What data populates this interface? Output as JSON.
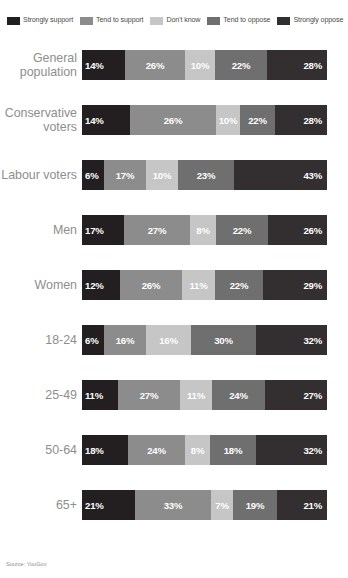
{
  "legend": {
    "items": [
      {
        "label": "Strongly support",
        "color": "#231f20"
      },
      {
        "label": "Tend to support",
        "color": "#8c8c8c"
      },
      {
        "label": "Don't know",
        "color": "#c6c6c6"
      },
      {
        "label": "Tend to oppose",
        "color": "#6f6f6f"
      },
      {
        "label": "Strongly oppose",
        "color": "#332f30"
      }
    ]
  },
  "source": {
    "text": "Source: YouGov"
  },
  "chart_data": {
    "type": "bar",
    "orientation": "horizontal",
    "stacked": true,
    "normalized": true,
    "title": "",
    "xlabel": "",
    "ylabel": "",
    "xlim": [
      0,
      100
    ],
    "grid": false,
    "legend_position": "top-left",
    "categories": [
      "General population",
      "Conservative voters",
      "Labour voters",
      "Men",
      "Women",
      "18-24",
      "25-49",
      "50-64",
      "65+"
    ],
    "series": [
      {
        "name": "Strongly support",
        "color": "#231f20",
        "values": [
          14,
          14,
          6,
          17,
          12,
          6,
          11,
          18,
          21
        ]
      },
      {
        "name": "Tend to support",
        "color": "#8c8c8c",
        "values": [
          26,
          26,
          17,
          27,
          26,
          16,
          27,
          24,
          33
        ]
      },
      {
        "name": "Don't know",
        "color": "#c6c6c6",
        "values": [
          10,
          10,
          10,
          8,
          11,
          16,
          11,
          8,
          7
        ]
      },
      {
        "name": "Tend to oppose",
        "color": "#6f6f6f",
        "values": [
          22,
          22,
          23,
          22,
          22,
          30,
          24,
          18,
          19
        ]
      },
      {
        "name": "Strongly oppose",
        "color": "#332f30",
        "values": [
          28,
          28,
          43,
          26,
          29,
          32,
          27,
          32,
          21
        ]
      }
    ]
  },
  "rows": [
    {
      "label": "General\npopulation",
      "label_lines": [
        "General",
        "population"
      ],
      "bar_top": 14,
      "bar_height": 30,
      "segments": [
        {
          "name": "Strongly support",
          "value": "14%",
          "color": "#231f20",
          "width": 43,
          "align": "left"
        },
        {
          "name": "Tend to support",
          "value": "26%",
          "color": "#8c8c8c",
          "width": 60,
          "align": "center"
        },
        {
          "name": "Don't know",
          "value": "10%",
          "color": "#c6c6c6",
          "width": 30,
          "align": "center"
        },
        {
          "name": "Tend to oppose",
          "value": "22%",
          "color": "#6f6f6f",
          "width": 52,
          "align": "center"
        },
        {
          "name": "Strongly oppose",
          "value": "28%",
          "color": "#332f30",
          "width": 60,
          "align": "right"
        }
      ]
    },
    {
      "label": "Conservative\nvoters",
      "label_lines": [
        "Conservative",
        "voters"
      ],
      "bar_top": 14,
      "bar_height": 30,
      "segments": [
        {
          "name": "Strongly support",
          "value": "14%",
          "color": "#231f20",
          "width": 48,
          "align": "left"
        },
        {
          "name": "Tend to support",
          "value": "26%",
          "color": "#8c8c8c",
          "width": 86,
          "align": "center"
        },
        {
          "name": "Don't know",
          "value": "10%",
          "color": "#c6c6c6",
          "width": 24,
          "align": "center"
        },
        {
          "name": "Tend to oppose",
          "value": "22%",
          "color": "#6f6f6f",
          "width": 35,
          "align": "center"
        },
        {
          "name": "Strongly oppose",
          "value": "28%",
          "color": "#332f30",
          "width": 52,
          "align": "right"
        }
      ]
    },
    {
      "label": "Labour voters",
      "label_lines": [
        "Labour voters"
      ],
      "bar_top": 14,
      "bar_height": 30,
      "segments": [
        {
          "name": "Strongly support",
          "value": "6%",
          "color": "#231f20",
          "width": 22,
          "align": "left"
        },
        {
          "name": "Tend to support",
          "value": "17%",
          "color": "#8c8c8c",
          "width": 42,
          "align": "center"
        },
        {
          "name": "Don't know",
          "value": "10%",
          "color": "#c6c6c6",
          "width": 32,
          "align": "center"
        },
        {
          "name": "Tend to oppose",
          "value": "23%",
          "color": "#6f6f6f",
          "width": 56,
          "align": "center"
        },
        {
          "name": "Strongly oppose",
          "value": "43%",
          "color": "#332f30",
          "width": 93,
          "align": "right"
        }
      ]
    },
    {
      "label": "Men",
      "label_lines": [
        "Men"
      ],
      "bar_top": 14,
      "bar_height": 30,
      "segments": [
        {
          "name": "Strongly support",
          "value": "17%",
          "color": "#231f20",
          "width": 42,
          "align": "left"
        },
        {
          "name": "Tend to support",
          "value": "27%",
          "color": "#8c8c8c",
          "width": 66,
          "align": "center"
        },
        {
          "name": "Don't know",
          "value": "8%",
          "color": "#c6c6c6",
          "width": 26,
          "align": "center"
        },
        {
          "name": "Tend to oppose",
          "value": "22%",
          "color": "#6f6f6f",
          "width": 52,
          "align": "center"
        },
        {
          "name": "Strongly oppose",
          "value": "26%",
          "color": "#332f30",
          "width": 59,
          "align": "right"
        }
      ]
    },
    {
      "label": "Women",
      "label_lines": [
        "Women"
      ],
      "bar_top": 14,
      "bar_height": 30,
      "segments": [
        {
          "name": "Strongly support",
          "value": "12%",
          "color": "#231f20",
          "width": 38,
          "align": "left"
        },
        {
          "name": "Tend to support",
          "value": "26%",
          "color": "#8c8c8c",
          "width": 62,
          "align": "center"
        },
        {
          "name": "Don't know",
          "value": "11%",
          "color": "#c6c6c6",
          "width": 33,
          "align": "center"
        },
        {
          "name": "Tend to oppose",
          "value": "22%",
          "color": "#6f6f6f",
          "width": 48,
          "align": "center"
        },
        {
          "name": "Strongly oppose",
          "value": "29%",
          "color": "#332f30",
          "width": 64,
          "align": "right"
        }
      ]
    },
    {
      "label": "18-24",
      "label_lines": [
        "18-24"
      ],
      "bar_top": 14,
      "bar_height": 30,
      "segments": [
        {
          "name": "Strongly support",
          "value": "6%",
          "color": "#231f20",
          "width": 22,
          "align": "left"
        },
        {
          "name": "Tend to support",
          "value": "16%",
          "color": "#8c8c8c",
          "width": 42,
          "align": "center"
        },
        {
          "name": "Don't know",
          "value": "16%",
          "color": "#c6c6c6",
          "width": 45,
          "align": "center"
        },
        {
          "name": "Tend to oppose",
          "value": "30%",
          "color": "#6f6f6f",
          "width": 65,
          "align": "center"
        },
        {
          "name": "Strongly oppose",
          "value": "32%",
          "color": "#332f30",
          "width": 71,
          "align": "right"
        }
      ]
    },
    {
      "label": "25-49",
      "label_lines": [
        "25-49"
      ],
      "bar_top": 14,
      "bar_height": 30,
      "segments": [
        {
          "name": "Strongly support",
          "value": "11%",
          "color": "#231f20",
          "width": 36,
          "align": "left"
        },
        {
          "name": "Tend to support",
          "value": "27%",
          "color": "#8c8c8c",
          "width": 62,
          "align": "center"
        },
        {
          "name": "Don't know",
          "value": "11%",
          "color": "#c6c6c6",
          "width": 32,
          "align": "center"
        },
        {
          "name": "Tend to oppose",
          "value": "24%",
          "color": "#6f6f6f",
          "width": 53,
          "align": "center"
        },
        {
          "name": "Strongly oppose",
          "value": "27%",
          "color": "#332f30",
          "width": 62,
          "align": "right"
        }
      ]
    },
    {
      "label": "50-64",
      "label_lines": [
        "50-64"
      ],
      "bar_top": 14,
      "bar_height": 30,
      "segments": [
        {
          "name": "Strongly support",
          "value": "18%",
          "color": "#231f20",
          "width": 46,
          "align": "left"
        },
        {
          "name": "Tend to support",
          "value": "24%",
          "color": "#8c8c8c",
          "width": 57,
          "align": "center"
        },
        {
          "name": "Don't know",
          "value": "8%",
          "color": "#c6c6c6",
          "width": 25,
          "align": "center"
        },
        {
          "name": "Tend to oppose",
          "value": "18%",
          "color": "#6f6f6f",
          "width": 46,
          "align": "center"
        },
        {
          "name": "Strongly oppose",
          "value": "32%",
          "color": "#332f30",
          "width": 71,
          "align": "right"
        }
      ]
    },
    {
      "label": "65+",
      "label_lines": [
        "65+"
      ],
      "bar_top": 14,
      "bar_height": 30,
      "segments": [
        {
          "name": "Strongly support",
          "value": "21%",
          "color": "#231f20",
          "width": 53,
          "align": "left"
        },
        {
          "name": "Tend to support",
          "value": "33%",
          "color": "#8c8c8c",
          "width": 76,
          "align": "center"
        },
        {
          "name": "Don't know",
          "value": "7%",
          "color": "#c6c6c6",
          "width": 22,
          "align": "center"
        },
        {
          "name": "Tend to oppose",
          "value": "19%",
          "color": "#6f6f6f",
          "width": 44,
          "align": "center"
        },
        {
          "name": "Strongly oppose",
          "value": "21%",
          "color": "#332f30",
          "width": 50,
          "align": "right"
        }
      ]
    }
  ]
}
